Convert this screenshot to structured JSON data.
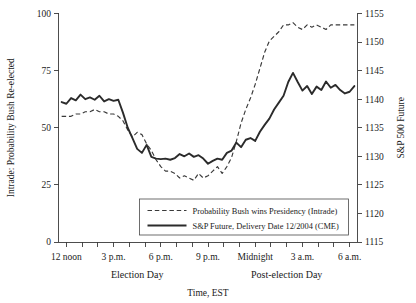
{
  "chart_data": {
    "type": "line",
    "title": "",
    "subtitle": "",
    "xlabel": "Time, EST",
    "grid": false,
    "legend_position": "inside-bottom-right",
    "x_axis": {
      "label": "Time, EST",
      "tick_labels": [
        "12 noon",
        "3 p.m.",
        "6 p.m.",
        "9 p.m.",
        "Midnight",
        "3 a.m.",
        "6 a.m."
      ],
      "tick_hours": [
        12,
        15,
        18,
        21,
        24,
        27,
        30
      ],
      "minor_tick_interval_hours": 1,
      "xlim_hours": [
        11.5,
        30.5
      ],
      "groups": [
        {
          "label": "Election Day",
          "center_hour": 16.5
        },
        {
          "label": "Post-election Day",
          "center_hour": 26.0
        }
      ]
    },
    "y_axis_left": {
      "label": "Intrade: Probability Bush Re-elected",
      "ticks": [
        0,
        25,
        50,
        75,
        100
      ],
      "ylim": [
        0,
        100
      ]
    },
    "y_axis_right": {
      "label": "S&P 500 Future",
      "ticks": [
        1115,
        1120,
        1125,
        1130,
        1135,
        1140,
        1145,
        1150,
        1155
      ],
      "ylim": [
        1115,
        1155
      ]
    },
    "series": [
      {
        "name": "Probability Bush wins Presidency (Intrade)",
        "axis": "left",
        "style": "dashed",
        "color": "#3a3a3a",
        "x": [
          11.7,
          12.0,
          12.3,
          12.6,
          12.9,
          13.2,
          13.5,
          13.8,
          14.1,
          14.4,
          14.7,
          15.0,
          15.3,
          15.6,
          15.9,
          16.2,
          16.5,
          16.8,
          17.1,
          17.4,
          17.7,
          18.0,
          18.3,
          18.6,
          18.9,
          19.2,
          19.5,
          19.8,
          20.1,
          20.4,
          20.7,
          21.0,
          21.3,
          21.6,
          21.9,
          22.2,
          22.5,
          22.8,
          23.1,
          23.4,
          23.7,
          24.0,
          24.3,
          24.6,
          24.9,
          25.2,
          25.5,
          25.8,
          26.1,
          26.4,
          26.7,
          27.0,
          27.3,
          27.6,
          27.9,
          28.2,
          28.5,
          28.8,
          29.1,
          29.4,
          29.7,
          30.0,
          30.3
        ],
        "y": [
          55,
          55,
          55,
          56,
          56,
          57,
          57,
          58,
          57,
          57,
          56,
          56,
          55,
          53,
          49,
          46,
          48,
          47,
          43,
          40,
          36,
          33,
          31,
          31,
          30,
          28,
          29,
          28,
          27,
          30,
          28,
          29,
          31,
          33,
          30,
          33,
          37,
          44,
          52,
          58,
          63,
          69,
          76,
          83,
          88,
          90,
          92,
          95,
          95,
          96,
          94,
          93,
          95,
          94,
          95,
          94,
          93,
          95,
          95,
          95,
          95,
          95,
          95
        ]
      },
      {
        "name": "S&P Future, Delivery Date 12/2004 (CME)",
        "axis": "right",
        "style": "solid",
        "color": "#2b2b2b",
        "x": [
          11.7,
          12.0,
          12.3,
          12.6,
          12.9,
          13.2,
          13.5,
          13.8,
          14.1,
          14.4,
          14.7,
          15.0,
          15.3,
          15.6,
          15.9,
          16.2,
          16.5,
          16.8,
          17.1,
          17.4,
          17.7,
          18.0,
          18.3,
          18.6,
          18.9,
          19.2,
          19.5,
          19.8,
          20.1,
          20.4,
          20.7,
          21.0,
          21.3,
          21.6,
          21.9,
          22.2,
          22.5,
          22.8,
          23.1,
          23.4,
          23.7,
          24.0,
          24.3,
          24.6,
          24.9,
          25.2,
          25.5,
          25.8,
          26.1,
          26.4,
          26.7,
          27.0,
          27.3,
          27.6,
          27.9,
          28.2,
          28.5,
          28.8,
          29.1,
          29.4,
          29.7,
          30.0,
          30.3
        ],
        "y": [
          1139.5,
          1139.2,
          1140.2,
          1139.8,
          1140.8,
          1140.0,
          1140.3,
          1139.9,
          1140.6,
          1139.6,
          1140.0,
          1139.7,
          1139.9,
          1137.6,
          1135.0,
          1133.2,
          1131.3,
          1130.6,
          1132.0,
          1129.9,
          1129.6,
          1129.5,
          1129.6,
          1129.4,
          1129.7,
          1130.4,
          1130.0,
          1130.5,
          1129.9,
          1130.2,
          1129.6,
          1128.7,
          1129.2,
          1129.6,
          1129.4,
          1130.6,
          1131.0,
          1132.4,
          1131.6,
          1132.9,
          1133.2,
          1132.7,
          1134.3,
          1135.5,
          1136.6,
          1138.2,
          1139.4,
          1140.6,
          1143.0,
          1144.6,
          1143.0,
          1141.5,
          1142.3,
          1140.9,
          1142.2,
          1141.6,
          1143.1,
          1142.0,
          1142.5,
          1141.6,
          1141.0,
          1141.3,
          1142.3
        ]
      }
    ],
    "legend": {
      "entries": [
        {
          "label": "Probability Bush wins Presidency (Intrade)",
          "style": "dashed"
        },
        {
          "label": "S&P Future, Delivery Date 12/2004 (CME)",
          "style": "solid"
        }
      ]
    }
  }
}
